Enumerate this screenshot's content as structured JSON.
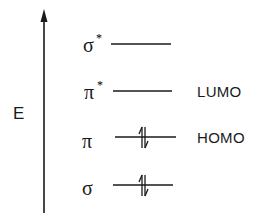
{
  "diagram": {
    "type": "molecular-orbital-energy-diagram",
    "axis": {
      "label": "E",
      "direction": "up"
    },
    "levels": [
      {
        "symbol": "σ",
        "superscript": "*",
        "annotation": "",
        "electrons": 0
      },
      {
        "symbol": "π",
        "superscript": "*",
        "annotation": "LUMO",
        "electrons": 0
      },
      {
        "symbol": "π",
        "superscript": "",
        "annotation": "HOMO",
        "electrons": 2
      },
      {
        "symbol": "σ",
        "superscript": "",
        "annotation": "",
        "electrons": 2
      }
    ],
    "colors": {
      "ink": "#1a1a1a",
      "background": "#ffffff"
    }
  }
}
